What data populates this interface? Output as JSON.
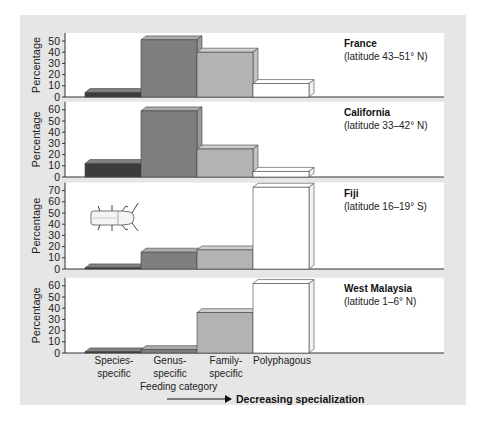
{
  "chart_data": {
    "type": "bar",
    "title": "",
    "xlabel": "Feeding category",
    "ylabel": "Percentage",
    "categories": [
      "Species-specific",
      "Genus-specific",
      "Family-specific",
      "Polyphagous"
    ],
    "category_lines": [
      [
        "Species-",
        "specific"
      ],
      [
        "Genus-",
        "specific"
      ],
      [
        "Family-",
        "specific"
      ],
      [
        "Polyphagous"
      ]
    ],
    "trend_label": "Decreasing specialization",
    "category_colors": [
      "#3c3c3c",
      "#7e7e7e",
      "#b3b3b3",
      "#ffffff"
    ],
    "panels": [
      {
        "name": "France",
        "subtitle": "(latitude 43–51° N)",
        "ylim": [
          0,
          50
        ],
        "yticks": [
          0,
          10,
          20,
          30,
          40,
          50
        ],
        "values": [
          4,
          51,
          40,
          12
        ]
      },
      {
        "name": "California",
        "subtitle": "(latitude 33–42° N)",
        "ylim": [
          0,
          60
        ],
        "yticks": [
          0,
          10,
          20,
          30,
          40,
          50,
          60
        ],
        "values": [
          12,
          59,
          25,
          5
        ]
      },
      {
        "name": "Fiji",
        "subtitle": "(latitude 16–19° S)",
        "ylim": [
          0,
          70
        ],
        "yticks": [
          0,
          10,
          20,
          30,
          40,
          50,
          60,
          70
        ],
        "values": [
          1,
          15,
          17,
          73
        ],
        "icon": "beetle-icon"
      },
      {
        "name": "West Malaysia",
        "subtitle": "(latitude 1–6° N)",
        "ylim": [
          0,
          60
        ],
        "yticks": [
          0,
          10,
          20,
          30,
          40,
          50,
          60
        ],
        "values": [
          1,
          3,
          36,
          62
        ]
      }
    ]
  }
}
